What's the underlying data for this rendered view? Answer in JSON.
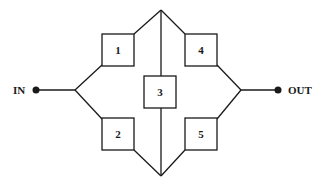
{
  "diagram": {
    "type": "reliability-block-diagram (bridge network)",
    "terminals": {
      "input": {
        "label": "IN"
      },
      "output": {
        "label": "OUT"
      }
    },
    "blocks": [
      {
        "id": "1",
        "label": "1",
        "position": "upper-left"
      },
      {
        "id": "2",
        "label": "2",
        "position": "lower-left"
      },
      {
        "id": "3",
        "label": "3",
        "position": "center-bridge"
      },
      {
        "id": "4",
        "label": "4",
        "position": "upper-right"
      },
      {
        "id": "5",
        "label": "5",
        "position": "lower-right"
      }
    ],
    "connections": [
      [
        "IN",
        "1"
      ],
      [
        "IN",
        "2"
      ],
      [
        "1",
        "top-node"
      ],
      [
        "2",
        "bottom-node"
      ],
      [
        "top-node",
        "3"
      ],
      [
        "3",
        "bottom-node"
      ],
      [
        "top-node",
        "4"
      ],
      [
        "bottom-node",
        "5"
      ],
      [
        "4",
        "OUT"
      ],
      [
        "5",
        "OUT"
      ]
    ],
    "colors": {
      "line": "#1a1a1a",
      "background": "#ffffff"
    }
  }
}
